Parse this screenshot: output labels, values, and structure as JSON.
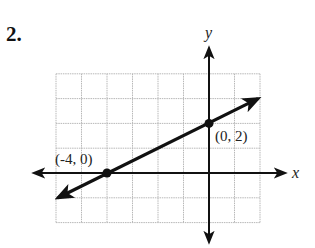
{
  "problem": {
    "number": "2."
  },
  "chart_data": {
    "type": "line",
    "title": "",
    "xlabel": "x",
    "ylabel": "y",
    "xlim": [
      -6,
      2
    ],
    "ylim": [
      -2,
      4
    ],
    "grid": true,
    "grid_step": 1,
    "series": [
      {
        "name": "line",
        "slope": 0.5,
        "intercept": 2,
        "x": [
          -6,
          2
        ],
        "y": [
          -1,
          3
        ],
        "arrows": "both"
      }
    ],
    "points": [
      {
        "x": -4,
        "y": 0,
        "label": "(-4, 0)"
      },
      {
        "x": 0,
        "y": 2,
        "label": "(0, 2)"
      }
    ],
    "colors": {
      "grid": "#b8b8b8",
      "axis": "#111111",
      "line": "#111111"
    }
  }
}
